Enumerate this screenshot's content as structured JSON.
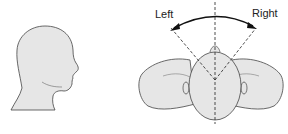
{
  "diagram": {
    "labels": {
      "left": "Left",
      "right": "Right"
    },
    "colors": {
      "fill": "#e6e6e6",
      "stroke": "#444444",
      "arrow": "#111111"
    },
    "panels": [
      {
        "name": "side-profile-head",
        "description": "Head in side profile facing right"
      },
      {
        "name": "top-view-head",
        "description": "Top view of head and shoulders with rotation arc"
      }
    ]
  }
}
